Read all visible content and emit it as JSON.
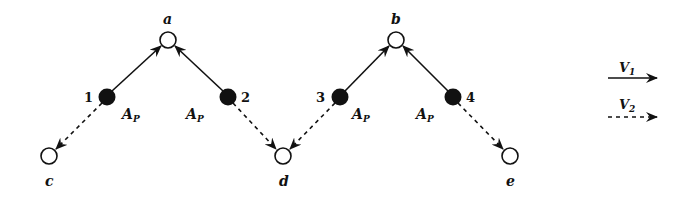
{
  "diagram": {
    "colors": {
      "ink": "#111111",
      "background": "#ffffff",
      "open_node_fill": "#ffffff",
      "filled_node_fill": "#111111"
    },
    "open_nodes": [
      {
        "id": "a",
        "label": "a",
        "x": 168,
        "y": 40
      },
      {
        "id": "b",
        "label": "b",
        "x": 396,
        "y": 40
      },
      {
        "id": "c",
        "label": "c",
        "x": 49,
        "y": 156
      },
      {
        "id": "d",
        "label": "d",
        "x": 283,
        "y": 156
      },
      {
        "id": "e",
        "label": "e",
        "x": 510,
        "y": 156
      }
    ],
    "filled_nodes": [
      {
        "id": "1",
        "label": "1",
        "x": 107,
        "y": 97,
        "annotation": {
          "base": "A",
          "sub": "P"
        }
      },
      {
        "id": "2",
        "label": "2",
        "x": 228,
        "y": 97,
        "annotation": {
          "base": "A",
          "sub": "P"
        }
      },
      {
        "id": "3",
        "label": "3",
        "x": 340,
        "y": 97,
        "annotation": {
          "base": "A",
          "sub": "P"
        }
      },
      {
        "id": "4",
        "label": "4",
        "x": 453,
        "y": 97,
        "annotation": {
          "base": "A",
          "sub": "P"
        }
      }
    ],
    "edges": [
      {
        "from": "1",
        "to": "a",
        "type": "V1",
        "style": "solid"
      },
      {
        "from": "2",
        "to": "a",
        "type": "V1",
        "style": "solid"
      },
      {
        "from": "3",
        "to": "b",
        "type": "V1",
        "style": "solid"
      },
      {
        "from": "4",
        "to": "b",
        "type": "V1",
        "style": "solid"
      },
      {
        "from": "1",
        "to": "c",
        "type": "V2",
        "style": "dashed"
      },
      {
        "from": "2",
        "to": "d",
        "type": "V2",
        "style": "dashed"
      },
      {
        "from": "3",
        "to": "d",
        "type": "V2",
        "style": "dashed"
      },
      {
        "from": "4",
        "to": "e",
        "type": "V2",
        "style": "dashed"
      }
    ],
    "legend": [
      {
        "base": "V",
        "sub": "1",
        "style": "solid"
      },
      {
        "base": "V",
        "sub": "2",
        "style": "dashed"
      }
    ]
  }
}
